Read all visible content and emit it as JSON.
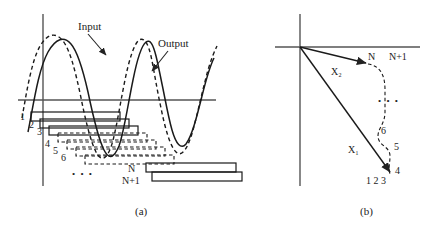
{
  "figure": {
    "panels": [
      {
        "id": "a",
        "caption": "(a)",
        "caption_x": 135,
        "caption_y": 214,
        "type": "waveform-with-frame-staircase",
        "axes": {
          "origin_x": 43,
          "origin_y": 100,
          "vertical_top": 14,
          "vertical_bottom": 186,
          "horizontal_left": 18,
          "horizontal_right": 216
        },
        "annotations": [
          {
            "name": "input-label",
            "text": "Input",
            "x": 78,
            "y": 30
          },
          {
            "name": "output-label",
            "text": "Output",
            "x": 158,
            "y": 47
          }
        ],
        "waveforms": [
          {
            "name": "input-waveform",
            "style": "dashed",
            "legend": "Input"
          },
          {
            "name": "output-waveform",
            "style": "solid",
            "legend": "Output"
          }
        ],
        "frames": [
          {
            "index": "1",
            "label_x": 20,
            "label_y": 120,
            "style": "solid"
          },
          {
            "index": "2",
            "label_x": 29,
            "label_y": 127,
            "style": "solid"
          },
          {
            "index": "3",
            "label_x": 37,
            "label_y": 134,
            "style": "solid"
          },
          {
            "index": "4",
            "label_x": 45,
            "label_y": 146,
            "style": "dashed"
          },
          {
            "index": "5",
            "label_x": 53,
            "label_y": 153,
            "style": "dashed"
          },
          {
            "index": "6",
            "label_x": 61,
            "label_y": 160,
            "style": "dashed"
          },
          {
            "index": "N",
            "label_x": 128,
            "label_y": 172,
            "style": "solid"
          },
          {
            "index": "N+1",
            "label_x": 125,
            "label_y": 184,
            "style": "solid"
          }
        ],
        "ellipsis": {
          "name": "frames-ellipsis",
          "text": "• • •",
          "x": 80,
          "y": 177
        }
      },
      {
        "id": "b",
        "caption": "(b)",
        "caption_x": 360,
        "caption_y": 214,
        "type": "vector-space-trajectory",
        "axes": {
          "origin_x": 300,
          "origin_y": 47,
          "vertical_top": 14,
          "vertical_bottom": 186,
          "horizontal_left": 275,
          "horizontal_right": 420
        },
        "vectors": [
          {
            "name": "vector-x2",
            "label": "X₂",
            "label_x": 334,
            "label_y": 72,
            "tip_x": 366,
            "tip_y": 62
          },
          {
            "name": "vector-x1",
            "label": "X₁",
            "label_x": 352,
            "label_y": 152,
            "tip_x": 391,
            "tip_y": 170
          }
        ],
        "trajectory_labels": [
          {
            "index": "1 2 3",
            "x": 375,
            "y": 184
          },
          {
            "index": "4",
            "x": 398,
            "y": 172
          },
          {
            "index": "5",
            "x": 398,
            "y": 148
          },
          {
            "index": "6",
            "x": 384,
            "y": 131
          },
          {
            "index": "N",
            "x": 370,
            "y": 58
          },
          {
            "index": "N+1",
            "x": 392,
            "y": 58
          }
        ],
        "ellipsis": {
          "name": "trajectory-ellipsis",
          "text": "• • •",
          "x": 384,
          "y": 101
        }
      }
    ]
  },
  "colors": {
    "stroke": "#222222",
    "text": "#222222",
    "background": "#ffffff"
  }
}
